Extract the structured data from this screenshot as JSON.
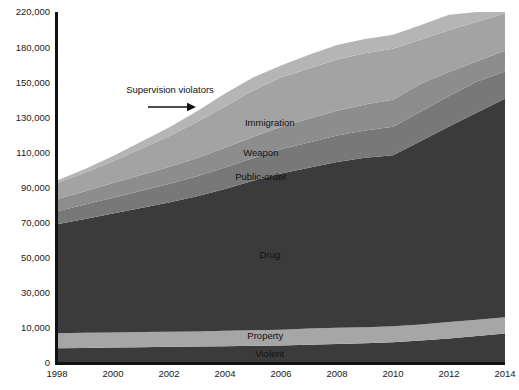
{
  "chart_data": {
    "type": "area",
    "title": "",
    "subtitle": "",
    "xlabel": "",
    "ylabel": "",
    "stacked": true,
    "grid": false,
    "legend_position": "inline-labels",
    "x": [
      1998,
      1999,
      2000,
      2001,
      2002,
      2003,
      2004,
      2005,
      2006,
      2007,
      2008,
      2009,
      2010,
      2011,
      2012,
      2013,
      2014
    ],
    "xticks": [
      "1998",
      "2000",
      "2002",
      "2004",
      "2006",
      "2008",
      "2010",
      "2012",
      "2014"
    ],
    "xtick_values": [
      1998,
      2000,
      2002,
      2004,
      2006,
      2008,
      2010,
      2012,
      2014
    ],
    "xlim": [
      1998,
      2014
    ],
    "yticks": [
      "0",
      "10,000",
      "30,000",
      "50,000",
      "70,000",
      "90,000",
      "110,000",
      "130,000",
      "150,000",
      "180,000",
      "220,000"
    ],
    "ytick_values": [
      0,
      10000,
      30000,
      50000,
      70000,
      90000,
      110000,
      130000,
      150000,
      180000,
      220000
    ],
    "ylim": [
      0,
      220000
    ],
    "yaxis_note": "tick labels are evenly spaced on the axis although the numeric steps are not uniform",
    "series": [
      {
        "name": "Violent",
        "color": "#3b3b3b",
        "values": [
          4200,
          4300,
          4400,
          4500,
          4600,
          4700,
          4800,
          4900,
          5000,
          5200,
          5400,
          5600,
          5900,
          6400,
          7000,
          7700,
          8400
        ]
      },
      {
        "name": "Property",
        "color": "#a6a6a6",
        "values": [
          4300,
          4300,
          4300,
          4300,
          4300,
          4300,
          4400,
          4400,
          4500,
          4600,
          4700,
          4800,
          5000,
          5600,
          6300,
          7000,
          7600
        ]
      },
      {
        "name": "Drug",
        "color": "#3b3b3b",
        "values": [
          60500,
          63500,
          66500,
          69500,
          72500,
          76000,
          80000,
          84500,
          88500,
          91500,
          94500,
          96500,
          97500,
          104500,
          111500,
          118000,
          124500
        ]
      },
      {
        "name": "Public-order",
        "color": "#787878",
        "values": [
          7500,
          8200,
          9000,
          9800,
          10600,
          11400,
          12200,
          13000,
          13800,
          14400,
          15000,
          15600,
          16200,
          16800,
          17400,
          18000,
          18600
        ]
      },
      {
        "name": "Weapon",
        "color": "#8d8d8d",
        "values": [
          7000,
          7600,
          8300,
          9000,
          9700,
          10400,
          11200,
          12000,
          12800,
          13500,
          14200,
          14800,
          15400,
          16000,
          16600,
          17200,
          17800
        ]
      },
      {
        "name": "Immigration",
        "color": "#a3a3a3",
        "values": [
          9000,
          10500,
          12500,
          15000,
          17500,
          20500,
          23500,
          26500,
          29500,
          32500,
          35500,
          37500,
          38500,
          39500,
          40500,
          41000,
          41500
        ]
      },
      {
        "name": "Supervision violators",
        "color": "#b5b5b5",
        "values": [
          1500,
          2200,
          3000,
          4000,
          5000,
          6200,
          7500,
          8800,
          10200,
          11800,
          13200,
          14500,
          15500,
          16500,
          17500,
          18500,
          19500
        ]
      }
    ],
    "inline_labels": [
      {
        "text": "Immigration",
        "x_pct": 47.5,
        "y_px": 126
      },
      {
        "text": "Weapon",
        "x_pct": 45.5,
        "y_px": 156
      },
      {
        "text": "Public-order",
        "x_pct": 45.5,
        "y_px": 180
      },
      {
        "text": "Drug",
        "x_pct": 47.5,
        "y_px": 258
      },
      {
        "text": "Property",
        "x_pct": 46.5,
        "y_px": 339
      },
      {
        "text": "Violent",
        "x_pct": 47.5,
        "y_px": 357
      }
    ],
    "annotations": [
      {
        "text": "Supervision violators",
        "label_x": 170,
        "label_y": 93,
        "arrow_from_x": 148,
        "arrow_from_y": 107,
        "arrow_to_x": 196,
        "arrow_to_y": 107
      }
    ],
    "axis_color": "#111111"
  }
}
